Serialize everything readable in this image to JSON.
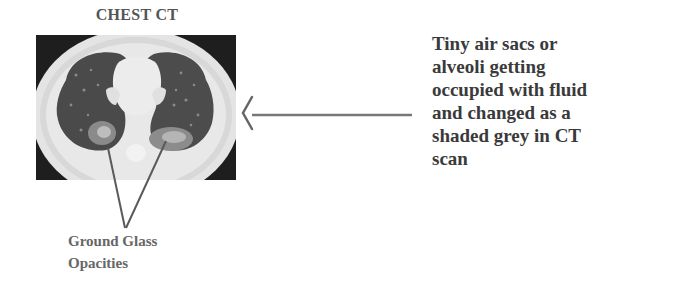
{
  "figure": {
    "title": "CHEST CT",
    "image_label": "chest-ct-scan",
    "annotation": {
      "label_line1": "Ground Glass",
      "label_line2": "Opacities"
    },
    "description_lines": [
      "Tiny air sacs or",
      "alveoli getting",
      "occupied with fluid",
      "and changed as a",
      "shaded grey in CT",
      "scan"
    ],
    "colors": {
      "text_dark": "#3a3a3a",
      "text_gray": "#555555",
      "line": "#666666",
      "lung": "#4a4a4a",
      "tissue": "#e6e6e6"
    }
  }
}
